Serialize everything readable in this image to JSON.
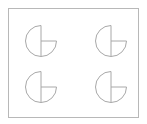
{
  "diagram": {
    "frame": {
      "x": 8.5,
      "y": 8.5,
      "width": 130,
      "height": 109,
      "stroke": "#b8b8b8"
    },
    "shape_stroke": "#a8a8a8",
    "shapes": [
      {
        "name": "three-quarter-circle-top-left",
        "cx": 41,
        "cy": 41,
        "r": 15.5
      },
      {
        "name": "three-quarter-circle-top-right",
        "cx": 111,
        "cy": 41,
        "r": 15.5
      },
      {
        "name": "three-quarter-circle-bottom-left",
        "cx": 41,
        "cy": 87,
        "r": 15.5
      },
      {
        "name": "three-quarter-circle-bottom-right",
        "cx": 111,
        "cy": 87,
        "r": 15.5
      }
    ]
  }
}
